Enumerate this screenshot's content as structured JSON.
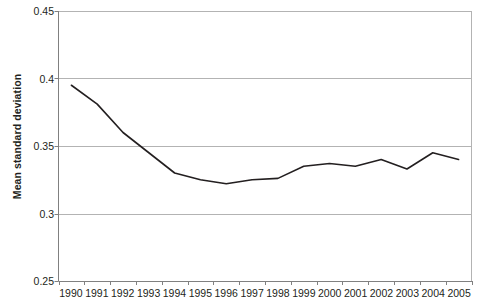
{
  "chart_data": {
    "type": "line",
    "title": "",
    "xlabel": "",
    "ylabel": "Mean standard deviation",
    "categories": [
      "1990",
      "1991",
      "1992",
      "1993",
      "1994",
      "1995",
      "1996",
      "1997",
      "1998",
      "1999",
      "2000",
      "2001",
      "2002",
      "2003",
      "2004",
      "2005"
    ],
    "values": [
      0.395,
      0.381,
      0.36,
      0.345,
      0.33,
      0.325,
      0.322,
      0.325,
      0.326,
      0.335,
      0.337,
      0.335,
      0.34,
      0.333,
      0.345,
      0.34
    ],
    "series": [
      {
        "name": "Mean standard deviation",
        "values": [
          0.395,
          0.381,
          0.36,
          0.345,
          0.33,
          0.325,
          0.322,
          0.325,
          0.326,
          0.335,
          0.337,
          0.335,
          0.34,
          0.333,
          0.345,
          0.34
        ]
      }
    ],
    "ylim": [
      0.25,
      0.45
    ],
    "ytick_labels": [
      "0.45",
      "0.4",
      "0.35",
      "0.3",
      "0.25"
    ],
    "ytick_values": [
      0.45,
      0.4,
      0.35,
      0.3,
      0.25
    ],
    "grid": true,
    "grid_axis": "y",
    "legend": false,
    "legend_position": "none",
    "line_color": "#231f20",
    "grid_color": "#b3b3b3",
    "axis_color": "#808080",
    "background_color": "#ffffff"
  },
  "axis": {
    "y_title": "Mean standard deviation"
  }
}
